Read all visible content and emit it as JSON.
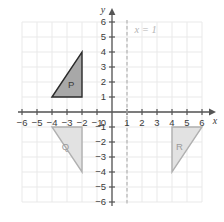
{
  "figure": {
    "kind": "coordinate-plane",
    "width": 224,
    "height": 222
  },
  "chart_data": {
    "type": "scatter",
    "title": "",
    "xlabel": "x",
    "ylabel": "y",
    "xlim": [
      -6,
      6
    ],
    "ylim": [
      -6,
      6
    ],
    "grid": true,
    "legend": "none",
    "x_ticks": [
      "-6",
      "-5",
      "-4",
      "-3",
      "-2",
      "-1",
      "0",
      "1",
      "2",
      "3",
      "4",
      "5",
      "6"
    ],
    "y_ticks": [
      "6",
      "5",
      "4",
      "3",
      "2",
      "1",
      "0",
      "-1",
      "-2",
      "-3",
      "-4",
      "-5",
      "-6"
    ],
    "origin_label": "0",
    "annotations": [
      {
        "name": "line-of-reflection",
        "text": "x = 1",
        "type": "vertical-dashed-line",
        "x": 1,
        "label_x": 1.5,
        "label_y": 5.5,
        "color": "#b4b4b4"
      }
    ],
    "shapes": [
      {
        "name": "triangle-p",
        "label": "P",
        "vertices": [
          [
            -4,
            1
          ],
          [
            -2,
            4
          ],
          [
            -2,
            1
          ]
        ],
        "fill": "#a8a8a8",
        "stroke": "#2b2b2b",
        "label_x": -2.72,
        "label_y": 1.85,
        "label_style": "dark"
      },
      {
        "name": "triangle-q",
        "label": "Q",
        "vertices": [
          [
            -4,
            -1
          ],
          [
            -2,
            -1
          ],
          [
            -2,
            -4
          ]
        ],
        "fill": "#e2e2e2",
        "stroke": "#b0b0b0",
        "label_x": -3.1,
        "label_y": -2.3,
        "label_style": "light"
      },
      {
        "name": "triangle-r",
        "label": "R",
        "vertices": [
          [
            4,
            -1
          ],
          [
            6,
            -1
          ],
          [
            4,
            -4
          ]
        ],
        "fill": "#e2e2e2",
        "stroke": "#b0b0b0",
        "label_x": 4.5,
        "label_y": -2.3,
        "label_style": "light"
      }
    ],
    "colors": {
      "grid": "#e9e9e9",
      "axis": "#555555",
      "background": "#ffffff"
    }
  },
  "axes": {
    "x_axis_name": "x",
    "y_axis_name": "y"
  }
}
